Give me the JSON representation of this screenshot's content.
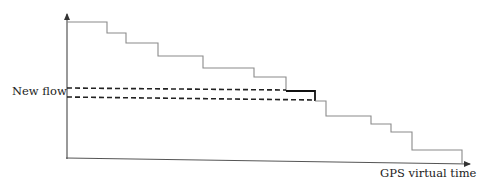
{
  "diagram": {
    "labels": {
      "new_flow": "New flow",
      "x_axis": "GPS virtual time"
    },
    "colors": {
      "axis": "#555555",
      "staircase": "#8a8a8a",
      "highlight": "#111111",
      "dashed": "#222222",
      "text": "#222222"
    },
    "staircase_steps": [
      {
        "x_start": 67,
        "x_end": 107,
        "y": 22
      },
      {
        "x_start": 107,
        "x_end": 126,
        "y": 33
      },
      {
        "x_start": 126,
        "x_end": 158,
        "y": 43
      },
      {
        "x_start": 158,
        "x_end": 203,
        "y": 56
      },
      {
        "x_start": 203,
        "x_end": 254,
        "y": 68
      },
      {
        "x_start": 254,
        "x_end": 286,
        "y": 77
      },
      {
        "x_start": 286,
        "x_end": 315,
        "y": 91,
        "highlighted": true
      },
      {
        "x_start": 315,
        "x_end": 326,
        "y": 101
      },
      {
        "x_start": 326,
        "x_end": 371,
        "y": 116
      },
      {
        "x_start": 371,
        "x_end": 391,
        "y": 124
      },
      {
        "x_start": 391,
        "x_end": 412,
        "y": 132
      },
      {
        "x_start": 412,
        "x_end": 462,
        "y": 150
      }
    ],
    "new_flow_dashed_lines": [
      {
        "y": 88,
        "x_start": 67,
        "x_end": 286
      },
      {
        "y": 97,
        "x_start": 67,
        "x_end": 315
      }
    ]
  }
}
